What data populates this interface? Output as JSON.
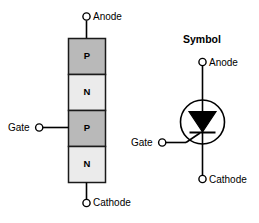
{
  "figure": {
    "title_symbol": "Symbol",
    "background_color": "#ffffff",
    "line_color": "#000000"
  },
  "structure_diagram": {
    "name": "scr-four-layer-structure",
    "layers": [
      {
        "label": "P",
        "fill": "#b9b9b9",
        "order": 1
      },
      {
        "label": "N",
        "fill": "#ebebeb",
        "order": 2
      },
      {
        "label": "P",
        "fill": "#b9b9b9",
        "order": 3
      },
      {
        "label": "N",
        "fill": "#ebebeb",
        "order": 4
      }
    ],
    "terminals": [
      {
        "name": "anode",
        "label": "Anode",
        "position": "top"
      },
      {
        "name": "gate",
        "label": "Gate",
        "position": "left"
      },
      {
        "name": "cathode",
        "label": "Cathode",
        "position": "bottom"
      }
    ]
  },
  "symbol_diagram": {
    "name": "scr-schematic-symbol",
    "heading": "Symbol",
    "terminals": [
      {
        "name": "anode",
        "label": "Anode",
        "position": "top"
      },
      {
        "name": "gate",
        "label": "Gate",
        "position": "left"
      },
      {
        "name": "cathode",
        "label": "Cathode",
        "position": "bottom"
      }
    ],
    "shapes": {
      "enclosure": "circle",
      "device": "triangle-with-bar",
      "triangle_direction": "down"
    }
  }
}
